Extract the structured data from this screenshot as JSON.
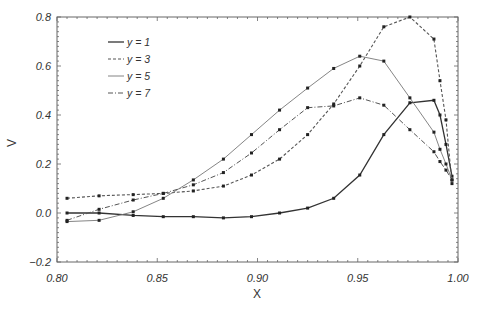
{
  "chart_data": {
    "type": "line",
    "title": "",
    "xlabel": "X",
    "ylabel": "V",
    "xlim": [
      0.8,
      1.0
    ],
    "ylim": [
      -0.2,
      0.8
    ],
    "xticks": [
      "0.80",
      "0.85",
      "0.90",
      "0.95",
      "1.00"
    ],
    "yticks": [
      "-0.2",
      "0.0",
      "0.2",
      "0.4",
      "0.6",
      "0.8"
    ],
    "grid": false,
    "legend_position": "upper-left",
    "x": [
      0.805,
      0.821,
      0.838,
      0.853,
      0.868,
      0.883,
      0.897,
      0.911,
      0.925,
      0.938,
      0.951,
      0.963,
      0.976,
      0.988,
      0.991,
      0.994,
      0.997
    ],
    "series": [
      {
        "name": "y = 1",
        "style": "solid",
        "color": "#333333",
        "values": [
          0.0,
          0.0,
          -0.01,
          -0.015,
          -0.015,
          -0.02,
          -0.015,
          0.0,
          0.02,
          0.06,
          0.155,
          0.32,
          0.45,
          0.46,
          0.4,
          0.28,
          0.15
        ]
      },
      {
        "name": "y = 3",
        "style": "dotted",
        "color": "#555555",
        "values": [
          0.06,
          0.07,
          0.075,
          0.08,
          0.09,
          0.11,
          0.155,
          0.22,
          0.32,
          0.445,
          0.6,
          0.76,
          0.8,
          0.71,
          0.54,
          0.38,
          0.12
        ]
      },
      {
        "name": "y = 5",
        "style": "thin-solid",
        "color": "#777777",
        "values": [
          -0.035,
          -0.03,
          0.005,
          0.06,
          0.135,
          0.22,
          0.32,
          0.42,
          0.51,
          0.59,
          0.64,
          0.62,
          0.47,
          0.33,
          0.26,
          0.2,
          0.135
        ]
      },
      {
        "name": "y = 7",
        "style": "dash-dot",
        "color": "#555555",
        "values": [
          -0.03,
          0.015,
          0.053,
          0.08,
          0.115,
          0.165,
          0.245,
          0.34,
          0.43,
          0.437,
          0.47,
          0.44,
          0.34,
          0.25,
          0.21,
          0.175,
          0.135
        ]
      }
    ]
  },
  "legend": {
    "items": [
      {
        "label": "y = 1"
      },
      {
        "label": "y = 3"
      },
      {
        "label": "y = 5"
      },
      {
        "label": "y = 7"
      }
    ]
  },
  "axes": {
    "x_label": "X",
    "y_label": "V"
  }
}
